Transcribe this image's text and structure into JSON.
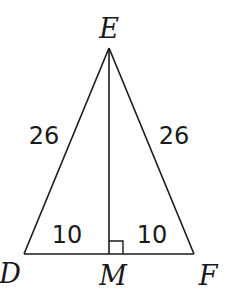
{
  "figure": {
    "type": "isosceles-triangle-with-altitude",
    "vertices": {
      "apex": "E",
      "base_left": "D",
      "base_right": "F",
      "foot_of_altitude": "M"
    },
    "side_labels": {
      "DE": "26",
      "EF": "26",
      "DM": "10",
      "MF": "10"
    },
    "right_angle_at": "M",
    "colors": {
      "stroke": "#1a1a1a",
      "background": "#ffffff"
    }
  }
}
